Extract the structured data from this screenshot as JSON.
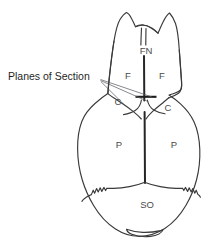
{
  "figure": {
    "type": "anatomical-line-diagram",
    "background_color": "#ffffff",
    "outline_color": "#3a3a3a",
    "label_color": "#4a4a4a",
    "callout_color": "#1f1f1f"
  },
  "callouts": [
    {
      "id": "planes-of-section",
      "label": "Planes of Section",
      "anchor": {
        "x": 8,
        "y": 77
      },
      "targets": [
        {
          "x": 152,
          "y": 97,
          "description": "coronal plane marker crossing sagittal suture"
        },
        {
          "x": 122,
          "y": 104,
          "description": "coronal suture, left side"
        }
      ]
    }
  ],
  "bone_labels": [
    {
      "id": "frontonasal",
      "abbr": "FN",
      "name": "Frontonasal / nasal bone",
      "x": 146,
      "y": 51
    },
    {
      "id": "frontal-left",
      "abbr": "F",
      "name": "Frontal bone (left)",
      "x": 128,
      "y": 76
    },
    {
      "id": "frontal-right",
      "abbr": "F",
      "name": "Frontal bone (right)",
      "x": 162,
      "y": 76
    },
    {
      "id": "coronal-left",
      "abbr": "C",
      "name": "Coronal suture (left)",
      "x": 118,
      "y": 102
    },
    {
      "id": "coronal-right",
      "abbr": "C",
      "name": "Coronal suture (right)",
      "x": 168,
      "y": 108
    },
    {
      "id": "parietal-left",
      "abbr": "P",
      "name": "Parietal bone (left)",
      "x": 119,
      "y": 145
    },
    {
      "id": "parietal-right",
      "abbr": "P",
      "name": "Parietal bone (right)",
      "x": 174,
      "y": 145
    },
    {
      "id": "supraoccipital",
      "abbr": "SO",
      "name": "Supraoccipital bone",
      "x": 147,
      "y": 205
    }
  ],
  "features": [
    {
      "id": "nasal-notch",
      "name": "internasal notch at rostral tip"
    },
    {
      "id": "sagittal-suture",
      "name": "sagittal / interfrontal suture, midline"
    },
    {
      "id": "lambdoid-suture",
      "name": "serrated lambdoid suture above supraoccipital"
    },
    {
      "id": "foramen-magnum",
      "name": "foramen magnum at caudal midline"
    }
  ]
}
